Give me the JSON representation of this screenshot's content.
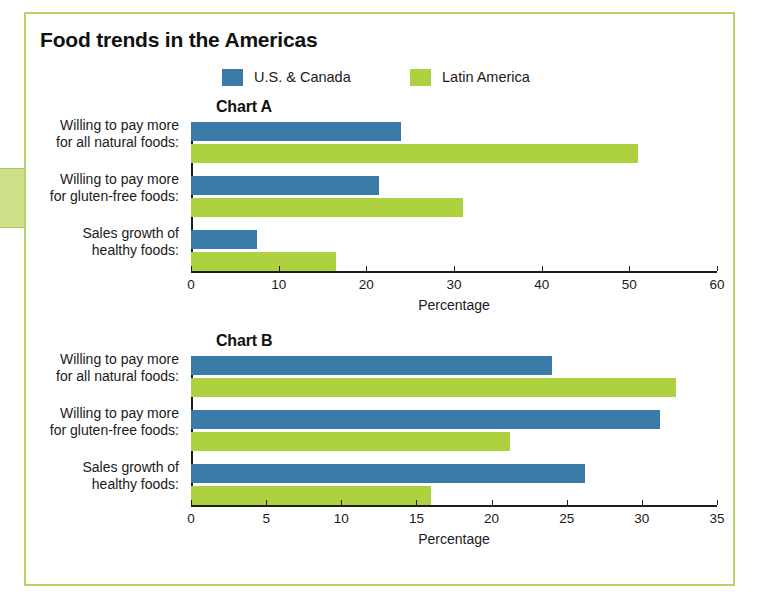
{
  "figure": {
    "title": "Food trends in the Americas"
  },
  "legend": {
    "items": [
      {
        "label": "U.S. & Canada",
        "color": "#3b7ba8",
        "key": "us_canada"
      },
      {
        "label": "Latin America",
        "color": "#aed13f",
        "key": "latin_america"
      }
    ]
  },
  "categories": [
    "Willing to pay more\nfor all natural foods:",
    "Willing to pay more\nfor gluten-free foods:",
    "Sales growth of\nhealthy foods:"
  ],
  "chart_data": [
    {
      "id": "chart-a",
      "type": "bar",
      "orientation": "horizontal",
      "title": "Chart A",
      "xlabel": "Percentage",
      "ylabel": "",
      "xlim": [
        0,
        60
      ],
      "xticks": [
        0,
        10,
        20,
        30,
        40,
        50,
        60
      ],
      "grid": false,
      "legend_position": "top",
      "categories": [
        "Willing to pay more for all natural foods:",
        "Willing to pay more for gluten-free foods:",
        "Sales growth of healthy foods:"
      ],
      "series": [
        {
          "name": "U.S. & Canada",
          "color": "#3b7ba8",
          "values": [
            24,
            21.5,
            7.5
          ]
        },
        {
          "name": "Latin America",
          "color": "#aed13f",
          "values": [
            51,
            31,
            16.5
          ]
        }
      ]
    },
    {
      "id": "chart-b",
      "type": "bar",
      "orientation": "horizontal",
      "title": "Chart B",
      "xlabel": "Percentage",
      "ylabel": "",
      "xlim": [
        0,
        35
      ],
      "xticks": [
        0,
        5,
        10,
        15,
        20,
        25,
        30,
        35
      ],
      "grid": false,
      "legend_position": "top",
      "categories": [
        "Willing to pay more for all natural foods:",
        "Willing to pay more for gluten-free foods:",
        "Sales growth of healthy foods:"
      ],
      "series": [
        {
          "name": "U.S. & Canada",
          "color": "#3b7ba8",
          "values": [
            24,
            31.2,
            26.2
          ]
        },
        {
          "name": "Latin America",
          "color": "#aed13f",
          "values": [
            32.3,
            21.2,
            16
          ]
        }
      ]
    }
  ],
  "colors": {
    "us_canada": "#3b7ba8",
    "latin_america": "#aed13f",
    "frame_border": "#b7d468",
    "page_tab": "#cfe08a",
    "axis": "#1d1d1d",
    "text": "#1a1a1a"
  }
}
